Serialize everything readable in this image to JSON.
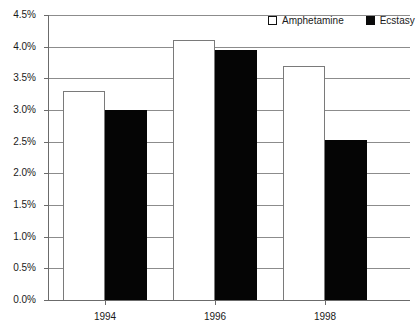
{
  "chart_data": {
    "type": "bar",
    "title": "",
    "subtitle": "",
    "xlabel": "",
    "ylabel": "",
    "categories": [
      "1994",
      "1996",
      "1998"
    ],
    "series": [
      {
        "name": "Amphetamine",
        "values": [
          3.3,
          4.1,
          3.7
        ],
        "color": "#ffffff"
      },
      {
        "name": "Ecstasy",
        "values": [
          3.0,
          3.95,
          2.53
        ],
        "color": "#050505"
      }
    ],
    "ylim": [
      0.0,
      4.5
    ],
    "ytick_values": [
      0.0,
      0.5,
      1.0,
      1.5,
      2.0,
      2.5,
      3.0,
      3.5,
      4.0,
      4.5
    ],
    "ytick_labels": [
      "0.0%",
      "0.5%",
      "1.0%",
      "1.5%",
      "2.0%",
      "2.5%",
      "3.0%",
      "3.5%",
      "4.0%",
      "4.5%"
    ],
    "value_suffix": "%",
    "grid": true,
    "grid_axis": "y",
    "legend_position": "top-right",
    "legend": [
      "Amphetamine",
      "Ecstasy"
    ]
  },
  "legend": {
    "entries": [
      {
        "label": "Amphetamine",
        "swatch": "white-square-outline"
      },
      {
        "label": "Ecstasy",
        "swatch": "black-square-filled"
      }
    ]
  },
  "axes": {
    "y_labels": [
      "4.5%",
      "4.0%",
      "3.5%",
      "3.0%",
      "2.5%",
      "2.0%",
      "1.5%",
      "1.0%",
      "0.5%",
      "0.0%"
    ],
    "x_labels": [
      "1994",
      "1996",
      "1998"
    ]
  },
  "colors": {
    "amphetamine": "#ffffff",
    "ecstasy": "#050505",
    "gridline": "#8c8c8c",
    "axis": "#6b6b6b",
    "text": "#1a1a1a",
    "background": "#ffffff"
  }
}
